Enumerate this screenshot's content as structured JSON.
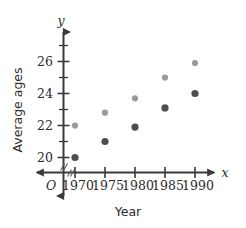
{
  "chart_data": {
    "type": "scatter",
    "title": "",
    "xlabel": "Year",
    "ylabel": "Average ages",
    "x_axis_variable": "x",
    "y_axis_variable": "y",
    "origin_label": "O",
    "x": [
      1970,
      1975,
      1980,
      1985,
      1990
    ],
    "xticklabels": [
      "1970",
      "1975",
      "1980",
      "1985",
      "1990"
    ],
    "yticklabels": [
      "20",
      "22",
      "24",
      "26"
    ],
    "yticks": [
      20,
      22,
      24,
      26
    ],
    "y_minor_ticks": [
      19,
      21,
      23,
      25,
      27
    ],
    "xlim": [
      1967.5,
      1992.5
    ],
    "ylim": [
      19,
      27
    ],
    "grid": false,
    "legend": "none",
    "axis_break": true,
    "series": [
      {
        "name": "light-series",
        "color": "#9a9a9a",
        "radius": 3.1,
        "values": [
          22.0,
          22.8,
          23.7,
          25.0,
          25.9
        ]
      },
      {
        "name": "dark-series",
        "color": "#4d4d4d",
        "radius": 3.6,
        "values": [
          20.0,
          21.0,
          21.9,
          23.1,
          24.0
        ]
      }
    ]
  },
  "colors": {
    "axis": "#3a3a3a",
    "text": "#2b2b2b",
    "background": "#ffffff",
    "light_marker": "#9a9a9a",
    "dark_marker": "#4d4d4d"
  }
}
